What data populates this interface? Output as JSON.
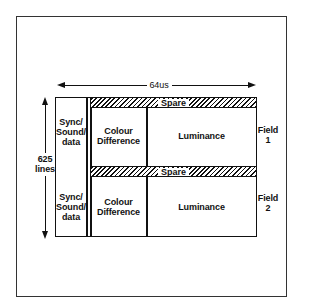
{
  "diagram": {
    "type": "video-line-structure",
    "duration_label": "64us",
    "lines_label": {
      "value": "625",
      "unit": "lines"
    },
    "fields": [
      {
        "name": "Field 1",
        "label_line1": "Field",
        "label_line2": "1",
        "spare_label": "Spare",
        "sync_label_lines": [
          "Sync/",
          "Sound/",
          "data"
        ],
        "colour_label_lines": [
          "Colour",
          "Difference"
        ],
        "luminance_label": "Luminance"
      },
      {
        "name": "Field 2",
        "label_line1": "Field",
        "label_line2": "2",
        "spare_label": "Spare",
        "sync_label_lines": [
          "Sync/",
          "Sound/",
          "data"
        ],
        "colour_label_lines": [
          "Colour",
          "Difference"
        ],
        "luminance_label": "Luminance"
      }
    ],
    "colors": {
      "line": "#111111",
      "background": "#ffffff",
      "frame": "#333333"
    }
  }
}
